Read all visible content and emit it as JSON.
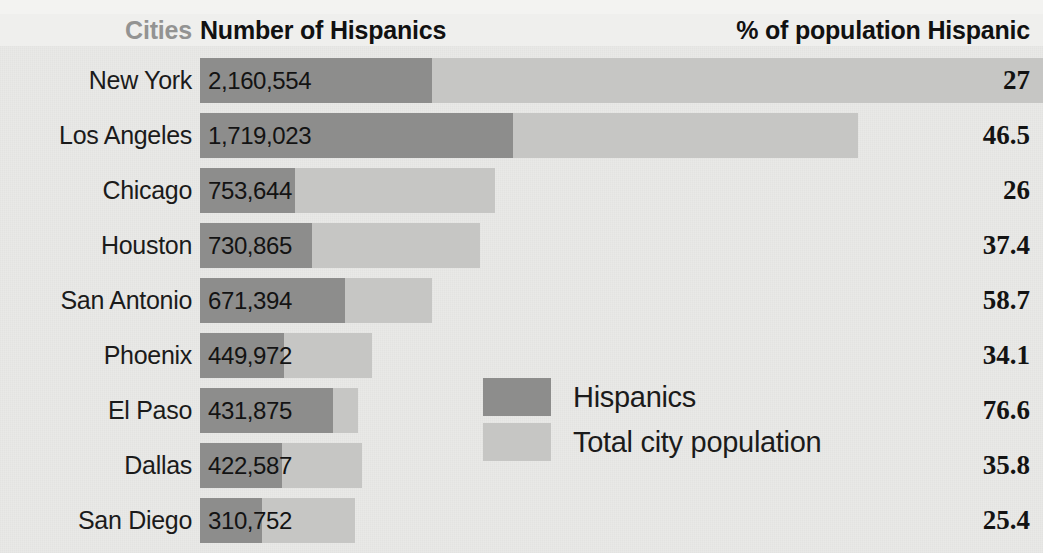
{
  "header": {
    "cities_label": "Cities",
    "number_label": "Number of Hispanics",
    "percent_label": "% of population Hispanic"
  },
  "legend": {
    "items": [
      {
        "label": "Hispanics",
        "color": "#8d8d8c",
        "key": "hispanics-swatch"
      },
      {
        "label": "Total city population",
        "color": "#c6c6c4",
        "key": "total-population-swatch"
      }
    ]
  },
  "colors": {
    "hispanics_bar": "#8d8d8c",
    "total_bar": "#c6c6c4",
    "background": "#e9e9e7",
    "header_band": "#efefed",
    "cities_header_text": "#939392",
    "body_text": "#131313"
  },
  "rows": [
    {
      "city": "New York",
      "number": "2,160,554",
      "percent": "27",
      "hisp_w": 232,
      "total_w": 843
    },
    {
      "city": "Los Angeles",
      "number": "1,719,023",
      "percent": "46.5",
      "hisp_w": 313,
      "total_w": 658
    },
    {
      "city": "Chicago",
      "number": "753,644",
      "percent": "26",
      "hisp_w": 95,
      "total_w": 295
    },
    {
      "city": "Houston",
      "number": "730,865",
      "percent": "37.4",
      "hisp_w": 112,
      "total_w": 280
    },
    {
      "city": "San Antonio",
      "number": "671,394",
      "percent": "58.7",
      "hisp_w": 145,
      "total_w": 232
    },
    {
      "city": "Phoenix",
      "number": "449,972",
      "percent": "34.1",
      "hisp_w": 84,
      "total_w": 172
    },
    {
      "city": "El Paso",
      "number": "431,875",
      "percent": "76.6",
      "hisp_w": 133,
      "total_w": 158
    },
    {
      "city": "Dallas",
      "number": "422,587",
      "percent": "35.8",
      "hisp_w": 82,
      "total_w": 162
    },
    {
      "city": "San Diego",
      "number": "310,752",
      "percent": "25.4",
      "hisp_w": 62,
      "total_w": 155
    }
  ],
  "chart_data": {
    "type": "bar",
    "title": "Number of Hispanics",
    "subtitle": "% of population Hispanic",
    "xlabel": "",
    "ylabel": "Cities",
    "orientation": "horizontal",
    "grid": false,
    "legend_position": "center",
    "categories": [
      "New York",
      "Los Angeles",
      "Chicago",
      "Houston",
      "San Antonio",
      "Phoenix",
      "El Paso",
      "Dallas",
      "San Diego"
    ],
    "series": [
      {
        "name": "Hispanics",
        "color": "#8d8d8c",
        "values": [
          2160554,
          1719023,
          753644,
          730865,
          671394,
          449972,
          431875,
          422587,
          310752
        ],
        "value_labels": [
          "2,160,554",
          "1,719,023",
          "753,644",
          "730,865",
          "671,394",
          "449,972",
          "431,875",
          "422,587",
          "310,752"
        ]
      },
      {
        "name": "Total city population",
        "color": "#c6c6c4",
        "values": [
          8002815,
          3696765,
          2898867,
          1954187,
          1143860,
          1319531,
          563662,
          1180453,
          1223400
        ],
        "value_labels": [
          null,
          null,
          null,
          null,
          null,
          null,
          null,
          null,
          null
        ]
      }
    ],
    "percent_hispanic": {
      "name": "% of population Hispanic",
      "values": [
        27,
        46.5,
        26,
        37.4,
        58.7,
        34.1,
        76.6,
        35.8,
        25.4
      ],
      "value_labels": [
        "27",
        "46.5",
        "26",
        "37.4",
        "58.7",
        "34.1",
        "76.6",
        "35.8",
        "25.4"
      ]
    }
  }
}
